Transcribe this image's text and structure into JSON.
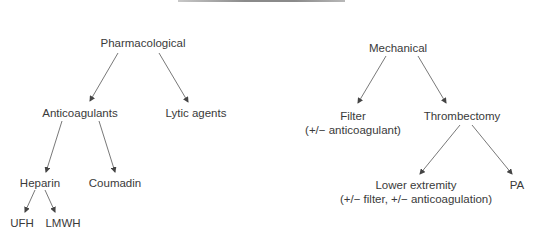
{
  "diagram": {
    "type": "tree",
    "trees": [
      {
        "root": "Pharmacological",
        "children": [
          {
            "label": "Anticoagulants",
            "children": [
              {
                "label": "Heparin",
                "children": [
                  {
                    "label": "UFH"
                  },
                  {
                    "label": "LMWH"
                  }
                ]
              },
              {
                "label": "Coumadin"
              }
            ]
          },
          {
            "label": "Lytic agents"
          }
        ]
      },
      {
        "root": "Mechanical",
        "children": [
          {
            "label": "Filter",
            "note": "(+/− anticoagulant)"
          },
          {
            "label": "Thrombectomy",
            "children": [
              {
                "label": "Lower extremity",
                "note": "(+/− filter, +/− anticoagulation)"
              },
              {
                "label": "PA"
              }
            ]
          }
        ]
      }
    ]
  },
  "nodes": {
    "pharmacological": "Pharmacological",
    "anticoagulants": "Anticoagulants",
    "lytic_agents": "Lytic agents",
    "heparin": "Heparin",
    "coumadin": "Coumadin",
    "ufh": "UFH",
    "lmwh": "LMWH",
    "mechanical": "Mechanical",
    "filter": "Filter",
    "filter_note": "(+/− anticoagulant)",
    "thrombectomy": "Thrombectomy",
    "lower_extremity": "Lower extremity",
    "lower_extremity_note": "(+/− filter, +/− anticoagulation)",
    "pa": "PA"
  },
  "colors": {
    "text": "#3a3a3a",
    "edge": "#444444",
    "background": "#ffffff"
  }
}
